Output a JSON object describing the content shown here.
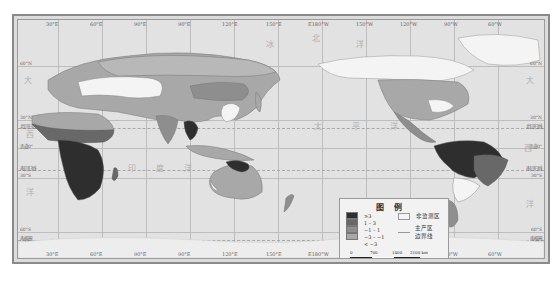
{
  "map": {
    "type": "choropleth world map (Pacific-centered)",
    "top_longitude_ticks": [
      "30°E",
      "60°E",
      "90°E",
      "90°E",
      "120°E",
      "150°E",
      "E180°W",
      "150°W",
      "120°W",
      "90°W",
      "60°W"
    ],
    "bottom_longitude_ticks": [
      "30°E",
      "60°E",
      "90°E",
      "90°E",
      "120°E",
      "150°E",
      "E180°W",
      "150°W",
      "120°W",
      "90°W",
      "60°W"
    ],
    "left_latitude_labels": [
      "60°N",
      "30°N",
      "北回归线",
      "赤道0°",
      "南回归线",
      "30°S",
      "60°S",
      "南极圈"
    ],
    "right_latitude_labels": [
      "60°N",
      "30°N",
      "北回归线",
      "赤道0°",
      "南回归线",
      "30°S",
      "60°S",
      "南极圈"
    ],
    "ocean_labels": {
      "arctic_1": "北",
      "arctic_2": "冰",
      "arctic_3": "洋",
      "atlantic_left": "大",
      "atlantic_right": "大",
      "west_left": "西",
      "west_right": "西",
      "ocean_left": "洋",
      "ocean_right": "洋",
      "indian_1": "印",
      "indian_2": "度",
      "indian_3": "洋",
      "pacific_1": "太",
      "pacific_2": "平",
      "pacific_3": "洋"
    },
    "colors": {
      "ocean": "#e2e2e2",
      "class_ge3": "#2e2e2e",
      "class_1_3": "#686868",
      "class_m1_1": "#8e8e8e",
      "class_m3_m1": "#a8a8a8",
      "class_lt_m3": "#c6c6c6",
      "unmonitored": "#f4f4f4",
      "antarctica": "#ededed"
    }
  },
  "legend": {
    "title": "图例",
    "classes": [
      {
        "label": "≥3",
        "color": "#2e2e2e"
      },
      {
        "label": "1 – 3",
        "color": "#686868"
      },
      {
        "label": "−1 – 1",
        "color": "#8e8e8e"
      },
      {
        "label": "−3 – −1",
        "color": "#a8a8a8"
      },
      {
        "label": "< −3",
        "color": "#c6c6c6"
      }
    ],
    "unmonitored_label": "非监测区",
    "boundary_label_1": "主产区",
    "boundary_label_2": "边界线",
    "scale": {
      "ticks": [
        "0",
        "700",
        "1400",
        "2100 km"
      ]
    }
  }
}
